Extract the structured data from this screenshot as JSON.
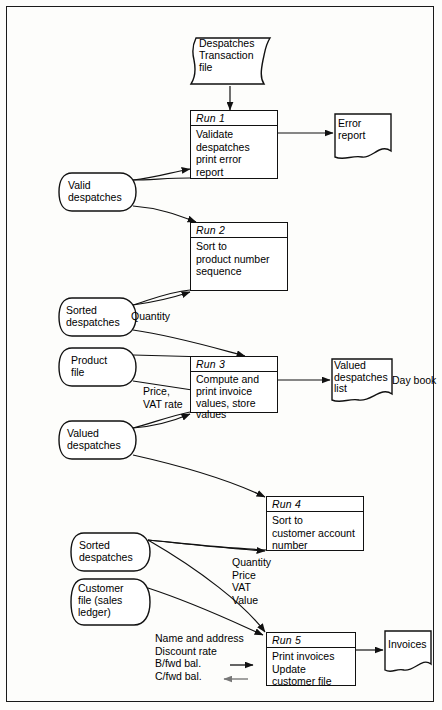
{
  "diagram": {
    "frame_color": "#1a1a1a"
  },
  "files": {
    "despatches_transaction": "Despatches\nTransaction\nfile",
    "valid_despatches": "Valid\ndespatches",
    "sorted_despatches_product": "Sorted\ndespatches",
    "product_file": "Product\nfile",
    "valued_despatches": "Valued\ndespatches",
    "sorted_despatches_customer": "Sorted\ndespatches",
    "customer_file": "Customer\nfile (sales\nledger)"
  },
  "processes": [
    {
      "id": "run1",
      "header": "Run 1",
      "body": "Validate\ndespatches\nprint error\nreport"
    },
    {
      "id": "run2",
      "header": "Run 2",
      "body": "Sort to\nproduct number\nsequence"
    },
    {
      "id": "run3",
      "header": "Run 3",
      "body": "Compute and\nprint invoice\nvalues, store\nvalues"
    },
    {
      "id": "run4",
      "header": "Run 4",
      "body": "Sort to\ncustomer account\nnumber"
    },
    {
      "id": "run5",
      "header": "Run 5",
      "body": "Print invoices\nUpdate\ncustomer file"
    }
  ],
  "documents": {
    "error_report": "Error\nreport",
    "valued_despatches_list": "Valued\ndespatches\nlist",
    "invoices": "Invoices"
  },
  "annotations": {
    "quantity": "Quantity",
    "price_vat_rate": "Price,\nVAT rate",
    "day_book": "Day book",
    "flow_fields": "Quantity\nPrice\nVAT\nValue",
    "customer_fields": "Name and address\nDiscount rate\nB/fwd bal.\nC/fwd bal."
  }
}
